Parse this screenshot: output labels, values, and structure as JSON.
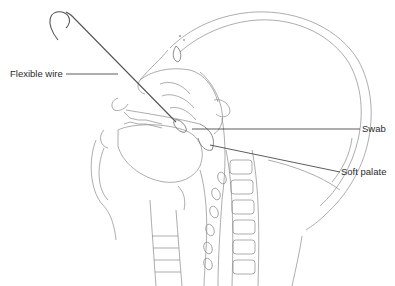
{
  "figure": {
    "labels": {
      "flexible_wire": "Flexible wire",
      "swab": "Swab",
      "soft_palate": "Soft palate"
    },
    "colors": {
      "background": "#ffffff",
      "line_art": "#8a8a8a",
      "leader_lines": "#333333",
      "label_text": "#2a2a2a"
    }
  }
}
